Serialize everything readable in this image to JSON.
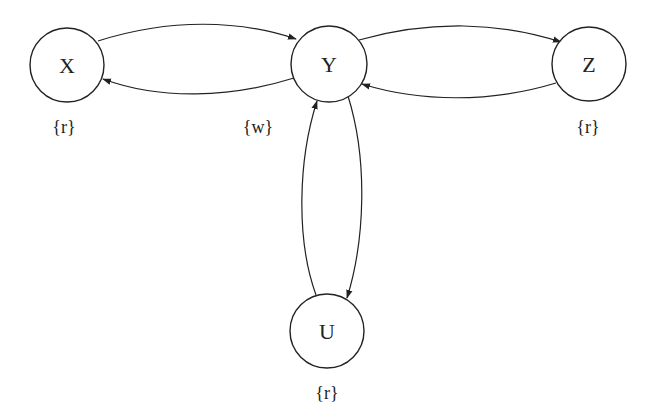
{
  "diagram": {
    "type": "directed-graph",
    "nodes": [
      {
        "id": "X",
        "label": "X",
        "annotation": "{r}",
        "cx": 67,
        "cy": 65
      },
      {
        "id": "Y",
        "label": "Y",
        "annotation": "{w}",
        "cx": 329,
        "cy": 64
      },
      {
        "id": "Z",
        "label": "Z",
        "annotation": "{r}",
        "cx": 589,
        "cy": 64
      },
      {
        "id": "U",
        "label": "U",
        "annotation": "{r}",
        "cx": 327,
        "cy": 331
      }
    ],
    "edges": [
      {
        "from": "X",
        "to": "Y"
      },
      {
        "from": "Y",
        "to": "X"
      },
      {
        "from": "Y",
        "to": "Z"
      },
      {
        "from": "Z",
        "to": "Y"
      },
      {
        "from": "Y",
        "to": "U"
      },
      {
        "from": "U",
        "to": "Y"
      }
    ]
  }
}
